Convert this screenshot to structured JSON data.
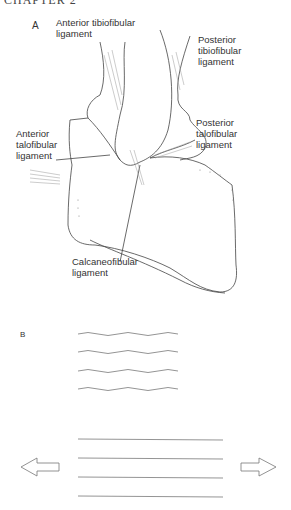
{
  "header": {
    "chapter": "CHAPTER 2"
  },
  "panel_a": {
    "letter": "A",
    "labels": {
      "anterior_tibiofibular": [
        "Anterior tibiofibular",
        "ligament"
      ],
      "posterior_tibiofibular": [
        "Posterior",
        "tibiofibular",
        "ligament"
      ],
      "anterior_talofibular": [
        "Anterior",
        "talofibular",
        "ligament"
      ],
      "posterior_talofibular": [
        "Posterior",
        "talofibular",
        "ligament"
      ],
      "calcaneofibular": [
        "Calcaneofibular",
        "ligament"
      ]
    }
  },
  "panel_b": {
    "letter": "B",
    "wavy_fiber_count": 4,
    "straight_fiber_count": 4,
    "arrows": [
      "left-arrow",
      "right-arrow"
    ]
  },
  "colors": {
    "line": "#444444",
    "fiber": "#888888",
    "background": "#ffffff"
  }
}
